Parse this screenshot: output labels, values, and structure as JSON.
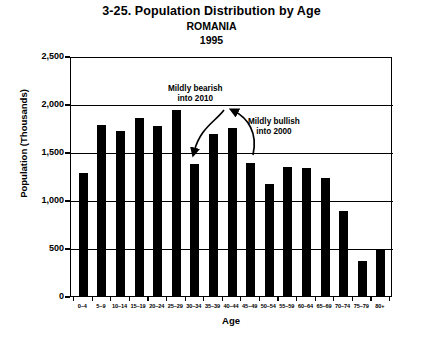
{
  "chart_data": {
    "type": "bar",
    "title": "3-25. Population Distribution by Age",
    "subtitle": "ROMANIA",
    "year": "1995",
    "xlabel": "Age",
    "ylabel": "Population (Thousands)",
    "ylim": [
      0,
      2500
    ],
    "ytick_labels": [
      "2,500",
      "2,000",
      "1,500",
      "1,000",
      "500",
      "0"
    ],
    "ytick_values": [
      2500,
      2000,
      1500,
      1000,
      500,
      0
    ],
    "grid": true,
    "legend": "none",
    "categories": [
      "0–4",
      "5–9",
      "10–14",
      "15–19",
      "20–24",
      "25–29",
      "30–34",
      "35–39",
      "40–44",
      "45–49",
      "50–54",
      "55–59",
      "60–64",
      "65–69",
      "70–74",
      "75–79",
      "80+"
    ],
    "values": [
      1290,
      1800,
      1730,
      1865,
      1790,
      1950,
      1385,
      1700,
      1760,
      1400,
      1180,
      1350,
      1340,
      1240,
      890,
      370,
      480
    ],
    "annotations": [
      {
        "name": "bearish",
        "line1": "Mildly bearish",
        "line2": "into 2010"
      },
      {
        "name": "bullish",
        "line1": "Mildly bullish",
        "line2": "into 2000"
      }
    ],
    "colors": {
      "bar": "#000000",
      "grid": "#000000",
      "background": "#ffffff"
    }
  }
}
